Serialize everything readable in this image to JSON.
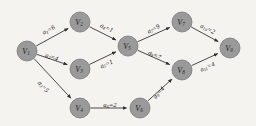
{
  "diagram": {
    "type": "directed-graph",
    "background_color": "#f4f3f0",
    "node_fill_color": "#9a9a9a",
    "node_stroke_color": "#6e6e6e",
    "edge_color": "#2b2b2b",
    "nodes": [
      {
        "id": "V1",
        "base": "V",
        "sub": "1",
        "x": 27,
        "y": 51,
        "r": 10
      },
      {
        "id": "V2",
        "base": "V",
        "sub": "2",
        "x": 80,
        "y": 22,
        "r": 10
      },
      {
        "id": "V3",
        "base": "V",
        "sub": "3",
        "x": 80,
        "y": 69,
        "r": 10
      },
      {
        "id": "V4",
        "base": "V",
        "sub": "4",
        "x": 80,
        "y": 108,
        "r": 10
      },
      {
        "id": "V5",
        "base": "V",
        "sub": "5",
        "x": 128,
        "y": 46,
        "r": 10
      },
      {
        "id": "V6",
        "base": "V",
        "sub": "6",
        "x": 140,
        "y": 108,
        "r": 10
      },
      {
        "id": "V7",
        "base": "V",
        "sub": "7",
        "x": 182,
        "y": 22,
        "r": 10
      },
      {
        "id": "V8",
        "base": "V",
        "sub": "8",
        "x": 182,
        "y": 70,
        "r": 10
      },
      {
        "id": "V9",
        "base": "V",
        "sub": "9",
        "x": 230,
        "y": 48,
        "r": 10
      }
    ],
    "edges": [
      {
        "id": "a1",
        "from": "V1",
        "to": "V2",
        "base": "a",
        "sub": "1",
        "weight": 6,
        "label": "a1=6",
        "lx": 48,
        "ly": 29,
        "rot": -29
      },
      {
        "id": "a2",
        "from": "V1",
        "to": "V3",
        "base": "a",
        "sub": "2",
        "weight": 4,
        "label": "a2=4",
        "lx": 52,
        "ly": 56,
        "rot": 18
      },
      {
        "id": "a3",
        "from": "V1",
        "to": "V4",
        "base": "a",
        "sub": "3",
        "weight": 5,
        "label": "a3=5",
        "lx": 44,
        "ly": 86,
        "rot": 47
      },
      {
        "id": "a4",
        "from": "V2",
        "to": "V5",
        "base": "a",
        "sub": "4",
        "weight": 1,
        "label": "a4=1",
        "lx": 107,
        "ly": 27,
        "rot": 26
      },
      {
        "id": "a5",
        "from": "V3",
        "to": "V5",
        "base": "a",
        "sub": "5",
        "weight": 1,
        "label": "a5=1",
        "lx": 106,
        "ly": 63,
        "rot": -24
      },
      {
        "id": "a6",
        "from": "V4",
        "to": "V6",
        "base": "a",
        "sub": "6",
        "weight": 2,
        "label": "a6=2",
        "lx": 110,
        "ly": 104,
        "rot": 0
      },
      {
        "id": "a7",
        "from": "V5",
        "to": "V7",
        "base": "a",
        "sub": "7",
        "weight": 9,
        "label": "a7=9",
        "lx": 153,
        "ly": 28,
        "rot": -27
      },
      {
        "id": "a8",
        "from": "V5",
        "to": "V8",
        "base": "a",
        "sub": "8",
        "weight": 7,
        "label": "a8=7",
        "lx": 155,
        "ly": 54,
        "rot": 25
      },
      {
        "id": "a9",
        "from": "V6",
        "to": "V8",
        "base": "a",
        "sub": "9",
        "weight": 4,
        "label": "a9=4",
        "lx": 158,
        "ly": 92,
        "rot": -48
      },
      {
        "id": "a10",
        "from": "V7",
        "to": "V9",
        "base": "a",
        "sub": "10",
        "weight": 2,
        "label": "a10=2",
        "lx": 208,
        "ly": 28,
        "rot": 26
      },
      {
        "id": "a11",
        "from": "V8",
        "to": "V9",
        "base": "a",
        "sub": "11",
        "weight": 4,
        "label": "a11=4",
        "lx": 207,
        "ly": 66,
        "rot": -24
      }
    ]
  }
}
